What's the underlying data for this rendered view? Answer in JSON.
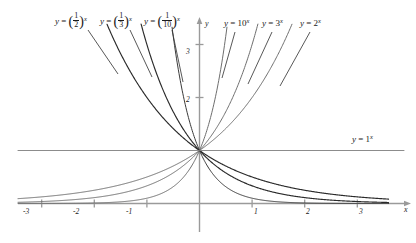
{
  "chart_data": {
    "type": "line",
    "title": "",
    "xlabel": "x",
    "ylabel": "y",
    "xlim": [
      -3.45,
      3.6
    ],
    "ylim": [
      -0.25,
      3.55
    ],
    "grid": false,
    "legend_position": "inline-curve-labels",
    "xticks": [
      -3,
      -2,
      -1,
      1,
      2,
      3
    ],
    "xtick_labels": [
      "-3",
      "-2",
      "-1",
      "1",
      "2",
      "3"
    ],
    "yticks": [
      2,
      3
    ],
    "ytick_labels": [
      "2",
      "3"
    ],
    "common_point": [
      0,
      1
    ],
    "series": [
      {
        "name": "y = (1/2)^x",
        "base": 0.5,
        "kind": "decay",
        "color": "#2b2b2b",
        "width": 1.15
      },
      {
        "name": "y = (1/3)^x",
        "base": 0.3333333,
        "kind": "decay",
        "color": "#2b2b2b",
        "width": 1.15
      },
      {
        "name": "y = (1/10)^x",
        "base": 0.1,
        "kind": "decay",
        "color": "#3a3a3a",
        "width": 1.0
      },
      {
        "name": "y = 1^x",
        "base": 1.0,
        "kind": "constant",
        "color": "#8c8c8c",
        "width": 1.0
      },
      {
        "name": "y = 10^x",
        "base": 10.0,
        "kind": "growth",
        "color": "#6e6e6e",
        "width": 1.0
      },
      {
        "name": "y = 3^x",
        "base": 3.0,
        "kind": "growth",
        "color": "#6e6e6e",
        "width": 1.0
      },
      {
        "name": "y = 2^x",
        "base": 2.0,
        "kind": "growth",
        "color": "#6e6e6e",
        "width": 1.0
      }
    ],
    "curve_labels": [
      {
        "id": "half",
        "base_num": "1",
        "base_den": "2",
        "exp": "x"
      },
      {
        "id": "third",
        "base_num": "1",
        "base_den": "3",
        "exp": "x"
      },
      {
        "id": "tenth",
        "base_num": "1",
        "base_den": "10",
        "exp": "x"
      },
      {
        "id": "ten",
        "base_plain": "10",
        "exp": "x"
      },
      {
        "id": "three",
        "base_plain": "3",
        "exp": "x"
      },
      {
        "id": "two",
        "base_plain": "2",
        "exp": "x"
      },
      {
        "id": "one",
        "base_plain": "1",
        "exp": "x"
      }
    ],
    "equals": "=",
    "y_symbol": "y",
    "axis_color": "#9a9a9a",
    "text_color": "#1a1a1a"
  }
}
